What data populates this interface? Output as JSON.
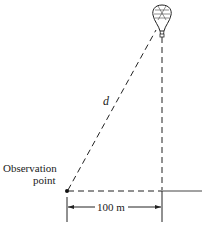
{
  "diagram": {
    "labels": {
      "distance": "d",
      "observation_line1": "Observation",
      "observation_line2": "point",
      "horizontal_distance": "100 m"
    },
    "elements": {
      "balloon_icon": "hot-air-balloon-icon",
      "observer_icon": "observation-point-dot"
    },
    "colors": {
      "line": "#222222",
      "background": "#ffffff"
    }
  }
}
